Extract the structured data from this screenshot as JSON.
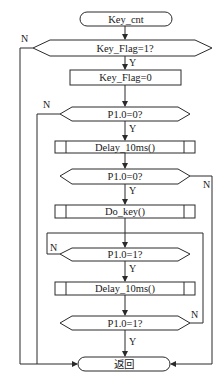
{
  "diagram": {
    "type": "flowchart",
    "nodes": {
      "start": {
        "label": "Key_cnt",
        "shape": "terminal"
      },
      "check_flag": {
        "label": "Key_Flag=1?",
        "shape": "decision"
      },
      "clear_flag": {
        "label": "Key_Flag=0",
        "shape": "process"
      },
      "check_press_1": {
        "label": "P1.0=0?",
        "shape": "decision"
      },
      "delay_1": {
        "label": "Delay_10ms()",
        "shape": "subroutine"
      },
      "check_press_2": {
        "label": "P1.0=0?",
        "shape": "decision"
      },
      "do_key": {
        "label": "Do_key()",
        "shape": "subroutine"
      },
      "check_release_1": {
        "label": "P1.0=1?",
        "shape": "decision"
      },
      "delay_2": {
        "label": "Delay_10ms()",
        "shape": "subroutine"
      },
      "check_release_2": {
        "label": "P1.0=1?",
        "shape": "decision"
      },
      "end": {
        "label": "返回",
        "shape": "terminal"
      }
    },
    "branch_labels": {
      "yes": "Y",
      "no": "N"
    },
    "edges": [
      {
        "from": "start",
        "to": "check_flag",
        "label": ""
      },
      {
        "from": "check_flag",
        "to": "clear_flag",
        "label": "Y"
      },
      {
        "from": "check_flag",
        "to": "end",
        "label": "N"
      },
      {
        "from": "clear_flag",
        "to": "check_press_1",
        "label": ""
      },
      {
        "from": "check_press_1",
        "to": "delay_1",
        "label": "Y"
      },
      {
        "from": "check_press_1",
        "to": "end",
        "label": "N"
      },
      {
        "from": "delay_1",
        "to": "check_press_2",
        "label": ""
      },
      {
        "from": "check_press_2",
        "to": "do_key",
        "label": "Y"
      },
      {
        "from": "check_press_2",
        "to": "end",
        "label": "N"
      },
      {
        "from": "do_key",
        "to": "check_release_1",
        "label": ""
      },
      {
        "from": "check_release_1",
        "to": "delay_2",
        "label": "Y"
      },
      {
        "from": "check_release_1",
        "to": "check_release_1",
        "label": "N"
      },
      {
        "from": "delay_2",
        "to": "check_release_2",
        "label": ""
      },
      {
        "from": "check_release_2",
        "to": "end",
        "label": "Y"
      },
      {
        "from": "check_release_2",
        "to": "check_release_1",
        "label": "N"
      }
    ]
  }
}
